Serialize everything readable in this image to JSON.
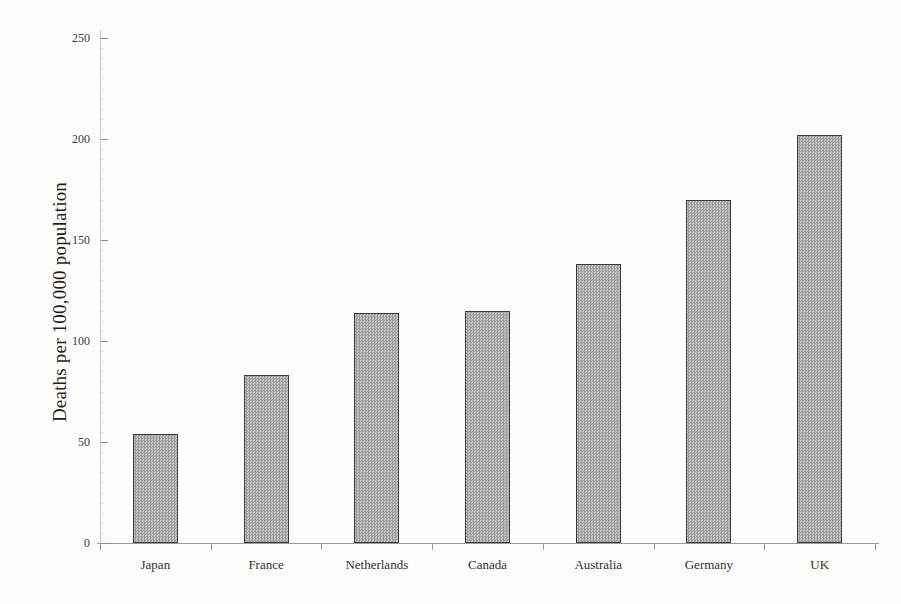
{
  "chart_data": {
    "type": "bar",
    "title": "",
    "subtitle": "",
    "xlabel": "",
    "ylabel": "Deaths per 100,000 population",
    "categories": [
      "Japan",
      "France",
      "Netherlands",
      "Canada",
      "Australia",
      "Germany",
      "UK"
    ],
    "values": [
      54,
      83,
      114,
      115,
      138,
      170,
      202
    ],
    "ylim": [
      0,
      250
    ],
    "yticks": [
      0,
      50,
      100,
      150,
      200,
      250
    ],
    "ytick_labels": [
      "0",
      "50",
      "100",
      "150",
      "200",
      "250"
    ],
    "grid": false,
    "legend": null,
    "legend_position": "none",
    "bar_fill_color": "#aaaaaa",
    "bar_edge_color": "#3a3a3a",
    "background_color": "#fdfdfc",
    "axis_color": "#9a9a9a",
    "series": [
      {
        "name": "Deaths per 100,000 population",
        "values": [
          54,
          83,
          114,
          115,
          138,
          170,
          202
        ]
      }
    ],
    "points": [
      {
        "category": "Japan",
        "value": 54
      },
      {
        "category": "France",
        "value": 83
      },
      {
        "category": "Netherlands",
        "value": 114
      },
      {
        "category": "Canada",
        "value": 115
      },
      {
        "category": "Australia",
        "value": 138
      },
      {
        "category": "Germany",
        "value": 170
      },
      {
        "category": "UK",
        "value": 202
      }
    ]
  }
}
